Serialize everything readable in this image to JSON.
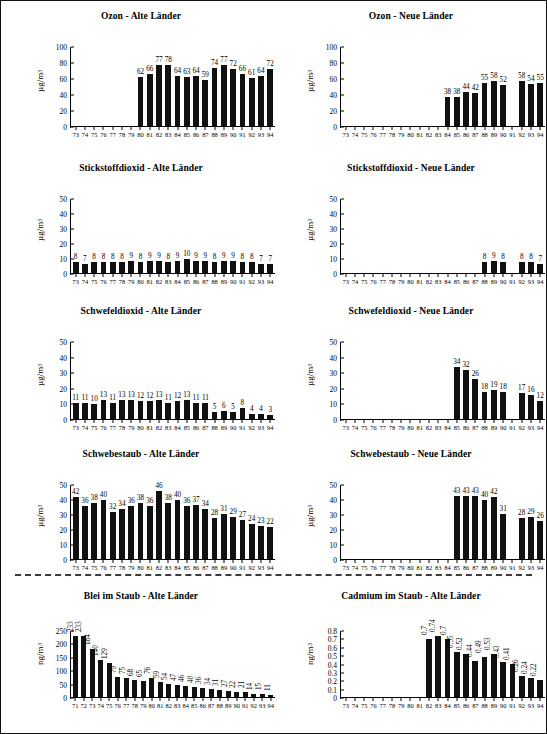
{
  "page": {
    "unit_ug": "µg/m",
    "unit_ng": "ng/m",
    "exp": "3"
  },
  "charts": [
    {
      "id": "ozon-alte-laender",
      "title": "Ozon - Alte Länder",
      "ylabel": "µg/m³",
      "unit_base": "µg/m",
      "unit_sup": "3",
      "yticks": [
        0,
        20,
        40,
        60,
        80,
        100
      ],
      "ymax": 100,
      "label_mode": "flat",
      "categories": [
        "73",
        "74",
        "75",
        "76",
        "77",
        "78",
        "79",
        "80",
        "81",
        "82",
        "83",
        "84",
        "85",
        "86",
        "87",
        "88",
        "89",
        "90",
        "91",
        "92",
        "93",
        "94"
      ],
      "values": [
        null,
        null,
        null,
        null,
        null,
        null,
        null,
        62,
        66,
        77,
        78,
        64,
        63,
        64,
        59,
        74,
        77,
        72,
        66,
        61,
        64,
        72
      ]
    },
    {
      "id": "ozon-neue-laender",
      "title": "Ozon - Neue Länder",
      "ylabel": "µg/m³",
      "unit_base": "µg/m",
      "unit_sup": "3",
      "yticks": [
        0,
        20,
        40,
        60,
        80,
        100
      ],
      "ymax": 100,
      "label_mode": "flat",
      "categories": [
        "73",
        "74",
        "75",
        "76",
        "77",
        "78",
        "79",
        "80",
        "81",
        "82",
        "83",
        "84",
        "85",
        "86",
        "87",
        "88",
        "89",
        "90",
        "91",
        "92",
        "93",
        "94"
      ],
      "values": [
        null,
        null,
        null,
        null,
        null,
        null,
        null,
        null,
        null,
        null,
        null,
        38,
        38,
        44,
        42,
        55,
        58,
        52,
        null,
        58,
        54,
        55
      ]
    },
    {
      "id": "stickstoffdioxid-alte-laender",
      "title": "Stickstoffdioxid - Alte Länder",
      "ylabel": "µg/m³",
      "unit_base": "µg/m",
      "unit_sup": "3",
      "yticks": [
        0,
        10,
        20,
        30,
        40,
        50
      ],
      "ymax": 50,
      "label_mode": "flat",
      "categories": [
        "73",
        "74",
        "75",
        "76",
        "77",
        "78",
        "79",
        "80",
        "81",
        "82",
        "83",
        "84",
        "85",
        "86",
        "87",
        "88",
        "89",
        "90",
        "91",
        "92",
        "93",
        "94"
      ],
      "values": [
        8,
        7,
        8,
        8,
        8,
        8,
        9,
        8,
        9,
        9,
        8,
        9,
        10,
        9,
        9,
        8,
        9,
        9,
        8,
        8,
        7,
        7
      ]
    },
    {
      "id": "stickstoffdioxid-neue-laender",
      "title": "Stickstoffdioxid - Neue Länder",
      "ylabel": "µg/m³",
      "unit_base": "µg/m",
      "unit_sup": "3",
      "yticks": [
        0,
        10,
        20,
        30,
        40,
        50
      ],
      "ymax": 50,
      "label_mode": "flat",
      "categories": [
        "73",
        "74",
        "75",
        "76",
        "77",
        "78",
        "79",
        "80",
        "81",
        "82",
        "83",
        "84",
        "85",
        "86",
        "87",
        "88",
        "89",
        "90",
        "91",
        "92",
        "93",
        "94"
      ],
      "values": [
        null,
        null,
        null,
        null,
        null,
        null,
        null,
        null,
        null,
        null,
        null,
        null,
        null,
        null,
        null,
        8,
        9,
        8,
        null,
        8,
        8,
        7
      ]
    },
    {
      "id": "schwefeldioxid-alte-laender",
      "title": "Schwefeldioxid - Alte Länder",
      "ylabel": "µg/m³",
      "unit_base": "µg/m",
      "unit_sup": "3",
      "yticks": [
        0,
        10,
        20,
        30,
        40,
        50
      ],
      "ymax": 50,
      "label_mode": "flat",
      "categories": [
        "73",
        "74",
        "75",
        "76",
        "77",
        "78",
        "79",
        "80",
        "81",
        "82",
        "83",
        "84",
        "85",
        "86",
        "87",
        "88",
        "89",
        "90",
        "91",
        "92",
        "93",
        "94"
      ],
      "values": [
        11,
        11,
        10,
        13,
        11,
        13,
        13,
        12,
        12,
        13,
        11,
        12,
        13,
        11,
        11,
        5,
        6,
        5,
        8,
        4,
        4,
        3
      ]
    },
    {
      "id": "schwefeldioxid-neue-laender",
      "title": "Schwefeldioxid - Neue Länder",
      "ylabel": "µg/m³",
      "unit_base": "µg/m",
      "unit_sup": "3",
      "yticks": [
        0,
        10,
        20,
        30,
        40,
        50
      ],
      "ymax": 50,
      "label_mode": "flat",
      "categories": [
        "73",
        "74",
        "75",
        "76",
        "77",
        "78",
        "79",
        "80",
        "81",
        "82",
        "83",
        "84",
        "85",
        "86",
        "87",
        "88",
        "89",
        "90",
        "91",
        "92",
        "93",
        "94"
      ],
      "values": [
        null,
        null,
        null,
        null,
        null,
        null,
        null,
        null,
        null,
        null,
        null,
        null,
        34,
        32,
        26,
        18,
        19,
        18,
        null,
        17,
        16,
        12
      ]
    },
    {
      "id": "schwebestaub-alte-laender",
      "title": "Schwebestaub - Alte Länder",
      "ylabel": "µg/m³",
      "unit_base": "µg/m",
      "unit_sup": "3",
      "yticks": [
        0,
        10,
        20,
        30,
        40,
        50
      ],
      "ymax": 50,
      "label_mode": "flat",
      "categories": [
        "73",
        "74",
        "75",
        "76",
        "77",
        "78",
        "79",
        "80",
        "81",
        "82",
        "83",
        "84",
        "85",
        "86",
        "87",
        "88",
        "89",
        "90",
        "91",
        "92",
        "93",
        "94"
      ],
      "values": [
        42,
        36,
        38,
        40,
        32,
        34,
        36,
        38,
        36,
        46,
        38,
        40,
        36,
        37,
        34,
        28,
        31,
        29,
        27,
        24,
        23,
        22
      ]
    },
    {
      "id": "schwebestaub-neue-laender",
      "title": "Schwebestaub - Neue Länder",
      "ylabel": "µg/m³",
      "unit_base": "µg/m",
      "unit_sup": "3",
      "yticks": [
        0,
        10,
        20,
        30,
        40,
        50
      ],
      "ymax": 50,
      "label_mode": "flat",
      "categories": [
        "73",
        "74",
        "75",
        "76",
        "77",
        "78",
        "79",
        "80",
        "81",
        "82",
        "83",
        "84",
        "85",
        "86",
        "87",
        "88",
        "89",
        "90",
        "91",
        "92",
        "93",
        "94"
      ],
      "values": [
        null,
        null,
        null,
        null,
        null,
        null,
        null,
        null,
        null,
        null,
        null,
        null,
        43,
        43,
        43,
        40,
        42,
        31,
        null,
        28,
        29,
        26
      ]
    },
    {
      "id": "blei-im-staub-alte-laender",
      "title": "Blei im Staub - Alte Länder",
      "ylabel": "ng/m³",
      "unit_base": "ng/m",
      "unit_sup": "3",
      "yticks": [
        0,
        50,
        100,
        150,
        200,
        250
      ],
      "ymax": 250,
      "label_mode": "rot",
      "categories": [
        "71",
        "72",
        "73",
        "74",
        "75",
        "76",
        "77",
        "78",
        "79",
        "80",
        "81",
        "82",
        "83",
        "84",
        "85",
        "86",
        "87",
        "88",
        "89",
        "90",
        "91",
        "92",
        "93",
        "94"
      ],
      "values": [
        233,
        233,
        184,
        140,
        129,
        79,
        75,
        68,
        65,
        76,
        59,
        54,
        47,
        46,
        40,
        36,
        34,
        31,
        27,
        22,
        21,
        14,
        15,
        11
      ]
    },
    {
      "id": "cadmium-im-staub-alte-laender",
      "title": "Cadmium im Staub - Alte Länder",
      "ylabel": "ng/m³",
      "unit_base": "ng/m",
      "unit_sup": "3",
      "yticks": [
        0,
        0.1,
        0.2,
        0.3,
        0.4,
        0.5,
        0.6,
        0.7,
        0.8
      ],
      "ymax": 0.8,
      "label_mode": "rot",
      "categories": [
        "73",
        "74",
        "75",
        "76",
        "77",
        "78",
        "79",
        "80",
        "81",
        "82",
        "83",
        "84",
        "85",
        "86",
        "87",
        "88",
        "89",
        "90",
        "91",
        "92",
        "93",
        "94"
      ],
      "values": [
        null,
        null,
        null,
        null,
        null,
        null,
        null,
        null,
        null,
        0.7,
        0.74,
        0.7,
        0.55,
        0.52,
        0.44,
        0.49,
        0.53,
        0.43,
        0.41,
        0.26,
        0.24,
        0.22
      ]
    }
  ],
  "chart_data": [
    {
      "type": "bar",
      "title": "Ozon - Alte Länder",
      "xlabel": "",
      "ylabel": "µg/m³",
      "ylim": [
        0,
        100
      ],
      "grid": false,
      "categories": [
        "73",
        "74",
        "75",
        "76",
        "77",
        "78",
        "79",
        "80",
        "81",
        "82",
        "83",
        "84",
        "85",
        "86",
        "87",
        "88",
        "89",
        "90",
        "91",
        "92",
        "93",
        "94"
      ],
      "values": [
        null,
        null,
        null,
        null,
        null,
        null,
        null,
        62,
        66,
        77,
        78,
        64,
        63,
        64,
        59,
        74,
        77,
        72,
        66,
        61,
        64,
        72
      ]
    },
    {
      "type": "bar",
      "title": "Ozon - Neue Länder",
      "xlabel": "",
      "ylabel": "µg/m³",
      "ylim": [
        0,
        100
      ],
      "grid": false,
      "categories": [
        "73",
        "74",
        "75",
        "76",
        "77",
        "78",
        "79",
        "80",
        "81",
        "82",
        "83",
        "84",
        "85",
        "86",
        "87",
        "88",
        "89",
        "90",
        "91",
        "92",
        "93",
        "94"
      ],
      "values": [
        null,
        null,
        null,
        null,
        null,
        null,
        null,
        null,
        null,
        null,
        null,
        38,
        38,
        44,
        42,
        55,
        58,
        52,
        null,
        58,
        54,
        55
      ]
    },
    {
      "type": "bar",
      "title": "Stickstoffdioxid - Alte Länder",
      "xlabel": "",
      "ylabel": "µg/m³",
      "ylim": [
        0,
        50
      ],
      "grid": false,
      "categories": [
        "73",
        "74",
        "75",
        "76",
        "77",
        "78",
        "79",
        "80",
        "81",
        "82",
        "83",
        "84",
        "85",
        "86",
        "87",
        "88",
        "89",
        "90",
        "91",
        "92",
        "93",
        "94"
      ],
      "values": [
        8,
        7,
        8,
        8,
        8,
        8,
        9,
        8,
        9,
        9,
        8,
        9,
        10,
        9,
        9,
        8,
        9,
        9,
        8,
        8,
        7,
        7
      ]
    },
    {
      "type": "bar",
      "title": "Stickstoffdioxid - Neue Länder",
      "xlabel": "",
      "ylabel": "µg/m³",
      "ylim": [
        0,
        50
      ],
      "grid": false,
      "categories": [
        "73",
        "74",
        "75",
        "76",
        "77",
        "78",
        "79",
        "80",
        "81",
        "82",
        "83",
        "84",
        "85",
        "86",
        "87",
        "88",
        "89",
        "90",
        "91",
        "92",
        "93",
        "94"
      ],
      "values": [
        null,
        null,
        null,
        null,
        null,
        null,
        null,
        null,
        null,
        null,
        null,
        null,
        null,
        null,
        null,
        8,
        9,
        8,
        null,
        8,
        8,
        7
      ]
    },
    {
      "type": "bar",
      "title": "Schwefeldioxid - Alte Länder",
      "xlabel": "",
      "ylabel": "µg/m³",
      "ylim": [
        0,
        50
      ],
      "grid": false,
      "categories": [
        "73",
        "74",
        "75",
        "76",
        "77",
        "78",
        "79",
        "80",
        "81",
        "82",
        "83",
        "84",
        "85",
        "86",
        "87",
        "88",
        "89",
        "90",
        "91",
        "92",
        "93",
        "94"
      ],
      "values": [
        11,
        11,
        10,
        13,
        11,
        13,
        13,
        12,
        12,
        13,
        11,
        12,
        13,
        11,
        11,
        5,
        6,
        5,
        8,
        4,
        4,
        3
      ]
    },
    {
      "type": "bar",
      "title": "Schwefeldioxid - Neue Länder",
      "xlabel": "",
      "ylabel": "µg/m³",
      "ylim": [
        0,
        50
      ],
      "grid": false,
      "categories": [
        "73",
        "74",
        "75",
        "76",
        "77",
        "78",
        "79",
        "80",
        "81",
        "82",
        "83",
        "84",
        "85",
        "86",
        "87",
        "88",
        "89",
        "90",
        "91",
        "92",
        "93",
        "94"
      ],
      "values": [
        null,
        null,
        null,
        null,
        null,
        null,
        null,
        null,
        null,
        null,
        null,
        null,
        34,
        32,
        26,
        18,
        19,
        18,
        null,
        17,
        16,
        12
      ]
    },
    {
      "type": "bar",
      "title": "Schwebestaub - Alte Länder",
      "xlabel": "",
      "ylabel": "µg/m³",
      "ylim": [
        0,
        50
      ],
      "grid": false,
      "categories": [
        "73",
        "74",
        "75",
        "76",
        "77",
        "78",
        "79",
        "80",
        "81",
        "82",
        "83",
        "84",
        "85",
        "86",
        "87",
        "88",
        "89",
        "90",
        "91",
        "92",
        "93",
        "94"
      ],
      "values": [
        42,
        36,
        38,
        40,
        32,
        34,
        36,
        38,
        36,
        46,
        38,
        40,
        36,
        37,
        34,
        28,
        31,
        29,
        27,
        24,
        23,
        22
      ]
    },
    {
      "type": "bar",
      "title": "Schwebestaub - Neue Länder",
      "xlabel": "",
      "ylabel": "µg/m³",
      "ylim": [
        0,
        50
      ],
      "grid": false,
      "categories": [
        "73",
        "74",
        "75",
        "76",
        "77",
        "78",
        "79",
        "80",
        "81",
        "82",
        "83",
        "84",
        "85",
        "86",
        "87",
        "88",
        "89",
        "90",
        "91",
        "92",
        "93",
        "94"
      ],
      "values": [
        null,
        null,
        null,
        null,
        null,
        null,
        null,
        null,
        null,
        null,
        null,
        null,
        43,
        43,
        43,
        40,
        42,
        31,
        null,
        28,
        29,
        26
      ]
    },
    {
      "type": "bar",
      "title": "Blei im Staub - Alte Länder",
      "xlabel": "",
      "ylabel": "ng/m³",
      "ylim": [
        0,
        250
      ],
      "grid": false,
      "categories": [
        "71",
        "72",
        "73",
        "74",
        "75",
        "76",
        "77",
        "78",
        "79",
        "80",
        "81",
        "82",
        "83",
        "84",
        "85",
        "86",
        "87",
        "88",
        "89",
        "90",
        "91",
        "92",
        "93",
        "94"
      ],
      "values": [
        233,
        233,
        184,
        140,
        129,
        79,
        75,
        68,
        65,
        76,
        59,
        54,
        47,
        46,
        40,
        36,
        34,
        31,
        27,
        22,
        21,
        14,
        15,
        11
      ]
    },
    {
      "type": "bar",
      "title": "Cadmium im Staub - Alte Länder",
      "xlabel": "",
      "ylabel": "ng/m³",
      "ylim": [
        0,
        0.8
      ],
      "grid": false,
      "categories": [
        "73",
        "74",
        "75",
        "76",
        "77",
        "78",
        "79",
        "80",
        "81",
        "82",
        "83",
        "84",
        "85",
        "86",
        "87",
        "88",
        "89",
        "90",
        "91",
        "92",
        "93",
        "94"
      ],
      "values": [
        null,
        null,
        null,
        null,
        null,
        null,
        null,
        null,
        null,
        0.7,
        0.74,
        0.7,
        0.55,
        0.52,
        0.44,
        0.49,
        0.53,
        0.43,
        0.41,
        0.26,
        0.24,
        0.22
      ]
    }
  ]
}
